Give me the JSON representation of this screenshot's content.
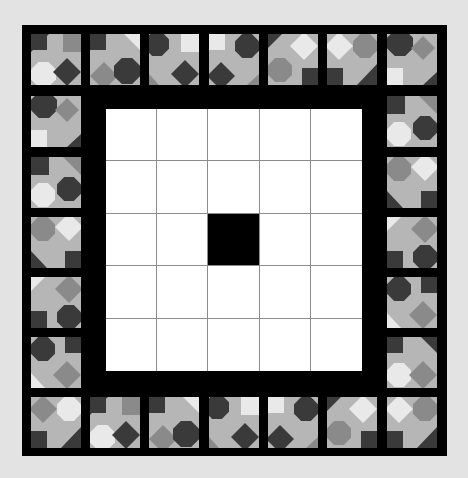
{
  "game": {
    "type": "tile-placement puzzle",
    "board": {
      "rows": 5,
      "cols": 5,
      "filled_cells": [
        [
          2,
          2
        ]
      ],
      "cell_color_empty": "#ffffff",
      "cell_color_filled": "#000000",
      "grid_line_color": "#8c8c8c"
    },
    "frame_color": "#000000",
    "background_color": "#e3e3e3",
    "tile_palette": {
      "base": "#b6b6b6",
      "dark": "#3a3a3a",
      "mid": "#8a8a8a",
      "light": "#e9e9e9"
    },
    "border_tiles": {
      "count": 24,
      "top": [
        "t0",
        "t1",
        "t2",
        "t3",
        "t4",
        "t5",
        "t6"
      ],
      "right": [
        "r1",
        "r2",
        "r3",
        "r4",
        "r5"
      ],
      "bottom": [
        "b0",
        "b1",
        "b2",
        "b3",
        "b4",
        "b5",
        "b6"
      ],
      "left": [
        "l1",
        "l2",
        "l3",
        "l4",
        "l5"
      ]
    }
  }
}
